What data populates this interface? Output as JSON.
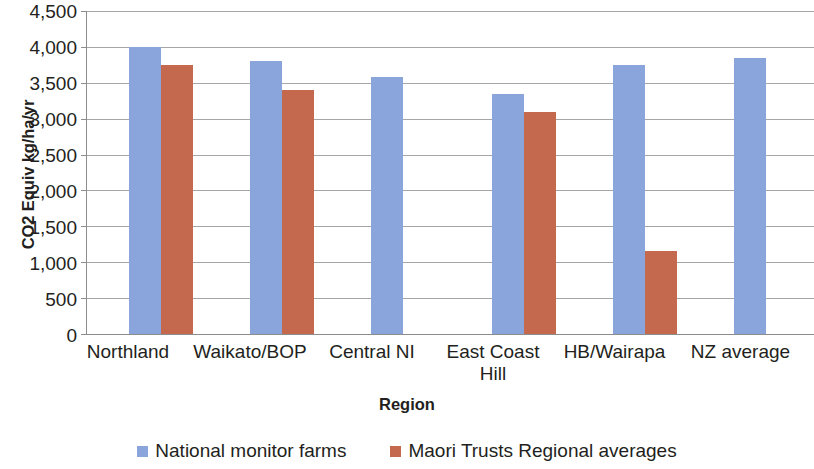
{
  "chart_data": {
    "type": "bar",
    "title": "",
    "xlabel": "Region",
    "ylabel": "CO2 Equiv kg/ha/yr",
    "categories": [
      "Northland",
      "Waikato/BOP",
      "Central NI",
      "East Coast Hill",
      "HB/Wairapa",
      "NZ average"
    ],
    "series": [
      {
        "name": "National monitor farms",
        "color": "#8aa5dc",
        "values": [
          4000,
          3800,
          3580,
          3350,
          3750,
          3850
        ]
      },
      {
        "name": "Maori Trusts Regional averages",
        "color": "#c4694d",
        "values": [
          3750,
          3400,
          null,
          3100,
          1150,
          null
        ]
      }
    ],
    "ylim": [
      0,
      4500
    ],
    "ytick_labels": [
      "4,500",
      "4,000",
      "3,500",
      "3,000",
      "2,500",
      "2,000",
      "1,500",
      "1,000",
      "500",
      "0"
    ],
    "ytick_values": [
      4500,
      4000,
      3500,
      3000,
      2500,
      2000,
      1500,
      1000,
      500,
      0
    ],
    "grid": true,
    "legend_position": "bottom"
  },
  "axes": {
    "y_title": "CO2 Equiv kg/ha/yr",
    "x_title": "Region"
  },
  "category_labels": {
    "c0": "Northland",
    "c1": "Waikato/BOP",
    "c2": "Central NI",
    "c3_line1": "East Coast",
    "c3_line2": "Hill",
    "c4": "HB/Wairapa",
    "c5": "NZ average"
  },
  "ticks": {
    "t0": "4,500",
    "t1": "4,000",
    "t2": "3,500",
    "t3": "3,000",
    "t4": "2,500",
    "t5": "2,000",
    "t6": "1,500",
    "t7": "1,000",
    "t8": "500",
    "t9": "0"
  },
  "legend": {
    "item_a": "National monitor farms",
    "item_b": "Maori Trusts Regional averages"
  }
}
